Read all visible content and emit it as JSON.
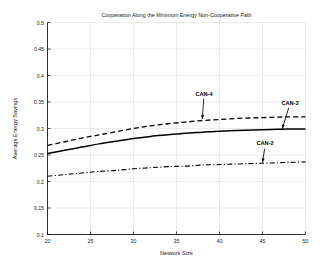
{
  "chart_data": {
    "type": "line",
    "title": "Cooperation Along the Minimum Energy Non-Cooperative Path",
    "xlabel": "Network Size",
    "ylabel": "Average Energy Savings",
    "xlim": [
      20,
      50
    ],
    "ylim": [
      0.1,
      0.5
    ],
    "xticks": [
      20,
      25,
      30,
      35,
      40,
      45,
      50
    ],
    "xtick_labels": [
      "20",
      "25",
      "30",
      "35",
      "40",
      "45",
      "50"
    ],
    "yticks": [
      0.1,
      0.15,
      0.2,
      0.25,
      0.3,
      0.35,
      0.4,
      0.45,
      0.5
    ],
    "ytick_labels": [
      "0.1",
      "0.15",
      "0.2",
      "0.25",
      "0.3",
      "0.35",
      "0.4",
      "0.45",
      "0.5"
    ],
    "grid": true,
    "legend": "none",
    "x": [
      20,
      22,
      24,
      26,
      28,
      30,
      32,
      34,
      36,
      38,
      40,
      42,
      44,
      46,
      48,
      50
    ],
    "series": [
      {
        "name": "CAN-4",
        "style": "dashed",
        "color": "#000000",
        "values": [
          0.268,
          0.275,
          0.282,
          0.288,
          0.294,
          0.3,
          0.305,
          0.309,
          0.312,
          0.315,
          0.317,
          0.319,
          0.32,
          0.321,
          0.322,
          0.322
        ]
      },
      {
        "name": "CAN-3",
        "style": "solid",
        "color": "#000000",
        "values": [
          0.253,
          0.259,
          0.265,
          0.271,
          0.276,
          0.281,
          0.285,
          0.288,
          0.291,
          0.293,
          0.295,
          0.296,
          0.297,
          0.298,
          0.299,
          0.299
        ]
      },
      {
        "name": "CAN-2",
        "style": "dashdot",
        "color": "#000000",
        "values": [
          0.21,
          0.213,
          0.216,
          0.219,
          0.221,
          0.224,
          0.226,
          0.228,
          0.229,
          0.231,
          0.232,
          0.233,
          0.234,
          0.235,
          0.236,
          0.237
        ]
      }
    ],
    "annotations": [
      {
        "label": "CAN-4",
        "text_x": 38.2,
        "text_y": 0.362,
        "point_x": 38.0,
        "point_y": 0.318
      },
      {
        "label": "CAN-3",
        "text_x": 48.2,
        "text_y": 0.345,
        "point_x": 47.3,
        "point_y": 0.3
      },
      {
        "label": "CAN-2",
        "text_x": 45.3,
        "text_y": 0.268,
        "point_x": 45.0,
        "point_y": 0.236
      }
    ]
  }
}
